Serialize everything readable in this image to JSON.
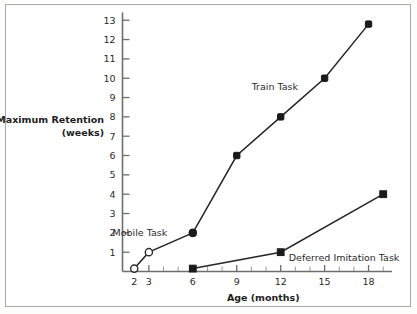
{
  "chart_data": {
    "type": "line",
    "title": "",
    "xlabel": "Age (months)",
    "ylabel": "Maximum Retention (weeks)",
    "ylabel_line1": "Maximum Retention",
    "ylabel_line2": "(weeks)",
    "xlim": [
      1.2,
      19.6
    ],
    "ylim": [
      0,
      13.4
    ],
    "grid": false,
    "legend_position": "inline-annotations",
    "x_ticks": [
      2,
      3,
      6,
      9,
      12,
      15,
      18
    ],
    "x_tick_labels": [
      "2",
      "3",
      "6",
      "9",
      "12",
      "15",
      "18"
    ],
    "x_minor_ticks": [
      4,
      5,
      7,
      8,
      10,
      11,
      13,
      14,
      16,
      17,
      19
    ],
    "y_ticks": [
      1,
      2,
      3,
      4,
      5,
      6,
      7,
      8,
      9,
      10,
      11,
      12,
      13
    ],
    "y_tick_labels": [
      "1",
      "2",
      "3",
      "4",
      "5",
      "6",
      "7",
      "8",
      "9",
      "10",
      "11",
      "12",
      "13"
    ],
    "series": [
      {
        "name": "Mobile Task",
        "marker": "open-circle",
        "x": [
          2,
          3,
          6
        ],
        "y": [
          0.15,
          1.0,
          2.0
        ],
        "label_x": 4.25,
        "label_y": 2.0,
        "label_anchor": "end"
      },
      {
        "name": "Train Task",
        "marker": "filled",
        "x": [
          6,
          9,
          12,
          15,
          18
        ],
        "y": [
          2.0,
          6.0,
          8.0,
          10.0,
          12.8
        ],
        "label_x": 11.6,
        "label_y": 9.55,
        "label_anchor": "middle"
      },
      {
        "name": "Deferred Imitation Task",
        "marker": "filled-square",
        "x": [
          6,
          12,
          19
        ],
        "y": [
          0.15,
          1.0,
          4.0
        ],
        "label_x": 12.55,
        "label_y": 0.72,
        "label_anchor": "start"
      }
    ],
    "colors": {
      "line": "#262626",
      "marker_fill": "#1a1a1a",
      "marker_open_fill": "#ffffff",
      "axis": "#6e6e6e",
      "text": "#2b2b2b",
      "frame": "#a9a9a9",
      "background": "#ffffff"
    }
  }
}
